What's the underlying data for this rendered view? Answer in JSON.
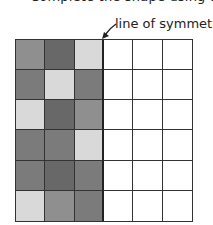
{
  "header": {
    "partial_text": "Complete the shape using the given line of symmetry."
  },
  "annotation": {
    "label": "line of symmetry",
    "arrow": "arrow-down-left-icon"
  },
  "palette": {
    "light": "#d9d9d9",
    "medium": "#8f8f8f",
    "mediumdark": "#7b7b7b",
    "dark": "#686868",
    "empty": "#ffffff",
    "line": "#333333"
  },
  "grid": {
    "rows": 6,
    "cols": 6,
    "symmetry_line_after_col": 3,
    "cells": [
      [
        "medium",
        "dark",
        "light",
        "empty",
        "empty",
        "empty"
      ],
      [
        "mediumdark",
        "light",
        "mediumdark",
        "empty",
        "empty",
        "empty"
      ],
      [
        "light",
        "dark",
        "medium",
        "empty",
        "empty",
        "empty"
      ],
      [
        "mediumdark",
        "mediumdark",
        "light",
        "empty",
        "empty",
        "empty"
      ],
      [
        "mediumdark",
        "dark",
        "mediumdark",
        "empty",
        "empty",
        "empty"
      ],
      [
        "light",
        "medium",
        "mediumdark",
        "empty",
        "empty",
        "empty"
      ]
    ]
  }
}
